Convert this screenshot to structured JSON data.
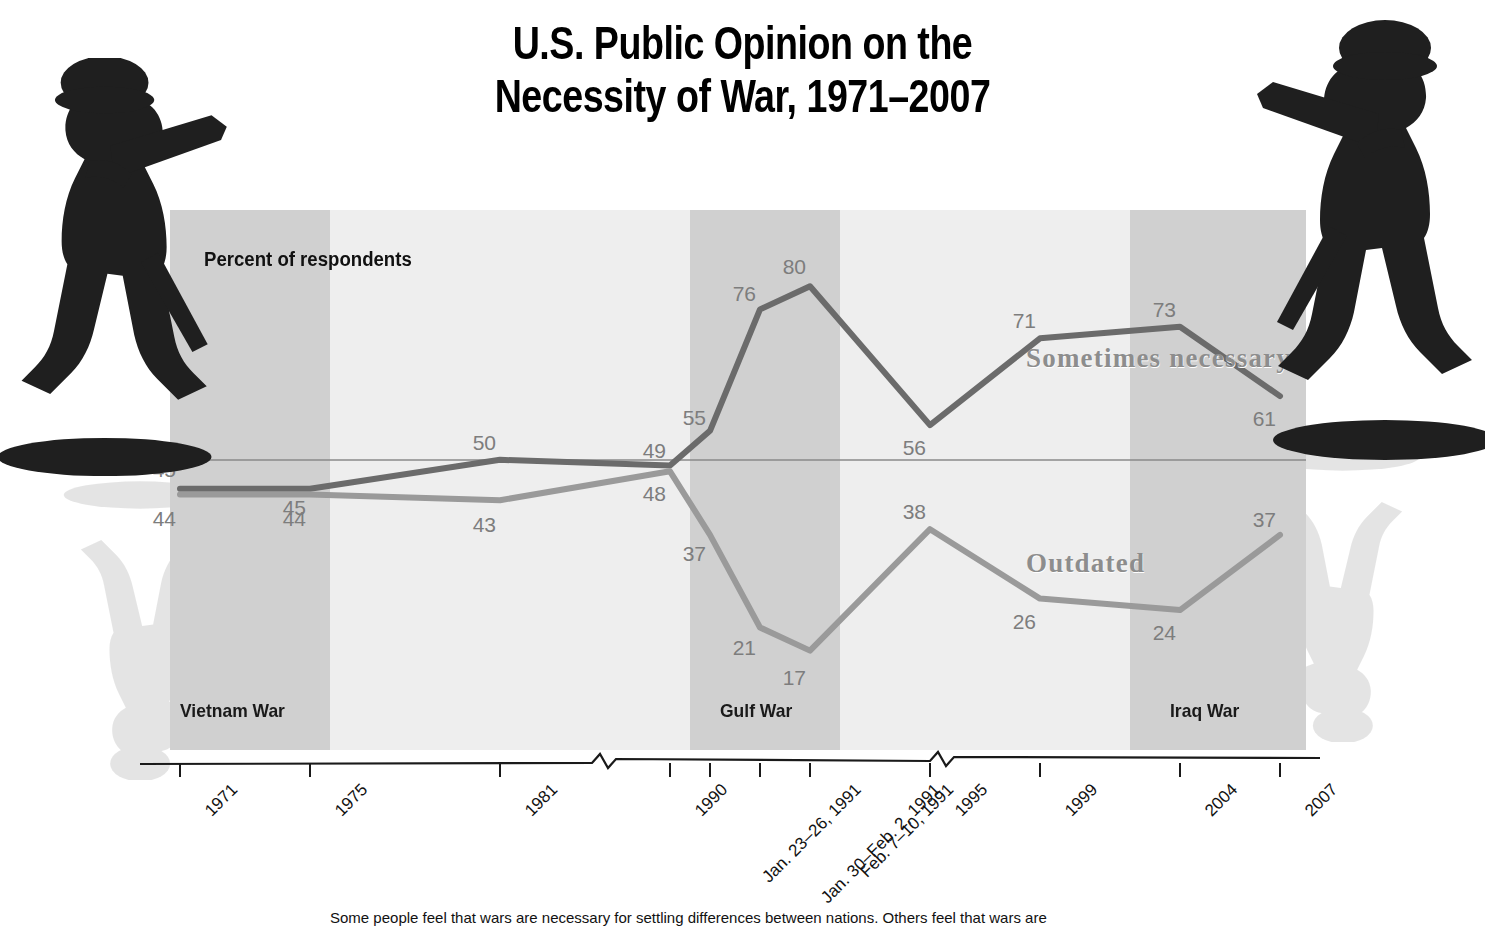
{
  "title": {
    "line1": "U.S. Public Opinion on the",
    "line2": "Necessity of War, 1971–2007"
  },
  "axis_title": "Percent of respondents",
  "caption": "Some people feel that wars are necessary for settling differences between nations. Others feel that wars are",
  "figures": [
    {
      "name": "toy-soldier-left",
      "color": "#1f1f1f"
    },
    {
      "name": "toy-soldier-right",
      "color": "#1f1f1f"
    }
  ],
  "colors": {
    "plot_background": "#eeeeee",
    "war_band": "#d0d0d0",
    "sometimes_necessary_line": "#6b6b6b",
    "outdated_line": "#9a9a9a",
    "label_text": "#7d7d7d",
    "title_text": "#000000"
  },
  "war_bands": [
    {
      "label": "Vietnam War",
      "start": 1971,
      "end": 1975
    },
    {
      "label": "Gulf War",
      "start": 1990,
      "end": 1991
    },
    {
      "label": "Iraq War",
      "start": 2003,
      "end": 2007
    }
  ],
  "chart_data": {
    "type": "line",
    "title": "U.S. Public Opinion on the Necessity of War, 1971–2007",
    "xlabel": "",
    "ylabel": "Percent of respondents",
    "ylim": [
      0,
      100
    ],
    "grid": false,
    "legend_position": "inline-labels",
    "axis_break": true,
    "categories": [
      "1971",
      "1975",
      "1981",
      "1990",
      "Jan. 23–26, 1991",
      "Jan. 30–Feb. 2, 1991",
      "Feb. 7–10, 1991",
      "1995",
      "1999",
      "2004",
      "2007"
    ],
    "series": [
      {
        "name": "Sometimes necessary",
        "color": "#6b6b6b",
        "values": [
          45,
          45,
          50,
          49,
          55,
          76,
          80,
          56,
          71,
          73,
          61
        ],
        "labels": [
          "45",
          "45",
          "50",
          "49",
          "55",
          "76",
          "80",
          "56",
          "71",
          "73",
          "61"
        ]
      },
      {
        "name": "Outdated",
        "color": "#9a9a9a",
        "values": [
          44,
          44,
          43,
          48,
          37,
          21,
          17,
          38,
          26,
          24,
          37
        ],
        "labels": [
          "44",
          "44",
          "43",
          "48",
          "37",
          "21",
          "17",
          "38",
          "26",
          "24",
          "37"
        ]
      }
    ],
    "annotations": [
      {
        "text": "Sometimes necessary",
        "kind": "series-label"
      },
      {
        "text": "Outdated",
        "kind": "series-label"
      }
    ]
  }
}
